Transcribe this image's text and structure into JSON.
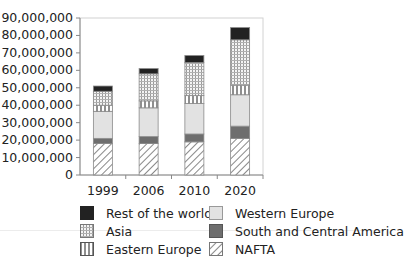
{
  "chart_data": {
    "type": "bar",
    "stacked": true,
    "title": "",
    "xlabel": "",
    "ylabel": "",
    "ylim": [
      0,
      90000000
    ],
    "yticks": [
      "0",
      "10,000,000",
      "20,000,000",
      "30,000,000",
      "40,000,000",
      "50,000,000",
      "60,000,000",
      "70,000,000",
      "80,000,000",
      "90,000,000"
    ],
    "categories": [
      "1999",
      "2006",
      "2010",
      "2020"
    ],
    "series": [
      {
        "name": "NAFTA",
        "pattern": "diagonal-hatch",
        "values": [
          18000000,
          18000000,
          19000000,
          21000000
        ]
      },
      {
        "name": "South and Central America",
        "pattern": "dark-gray",
        "values": [
          3000000,
          4000000,
          4500000,
          7000000
        ]
      },
      {
        "name": "Western Europe",
        "pattern": "light-gray",
        "values": [
          15500000,
          16500000,
          17500000,
          18000000
        ]
      },
      {
        "name": "Eastern Europe",
        "pattern": "vertical-lines",
        "values": [
          3500000,
          4000000,
          4500000,
          5500000
        ]
      },
      {
        "name": "Asia",
        "pattern": "grid-dots",
        "values": [
          8000000,
          15500000,
          19000000,
          26000000
        ]
      },
      {
        "name": "Rest of the world",
        "pattern": "black",
        "values": [
          3000000,
          3000000,
          4000000,
          7000000
        ]
      }
    ],
    "totals": [
      51000000,
      61000000,
      68500000,
      84500000
    ],
    "grid": false,
    "legend_position": "bottom"
  },
  "legend": {
    "items": [
      {
        "label": "Rest of the world",
        "key": "row"
      },
      {
        "label": "Western Europe",
        "key": "weu"
      },
      {
        "label": "Asia",
        "key": "asia"
      },
      {
        "label": "South and Central America",
        "key": "sca"
      },
      {
        "label": "Eastern Europe",
        "key": "eeu"
      },
      {
        "label": "NAFTA",
        "key": "nafta"
      }
    ]
  },
  "colors": {
    "black": "#222222",
    "dark_gray": "#6e6e6e",
    "light_gray": "#e2e2e2",
    "axis": "#888888",
    "frame": "#cfcfcf"
  }
}
